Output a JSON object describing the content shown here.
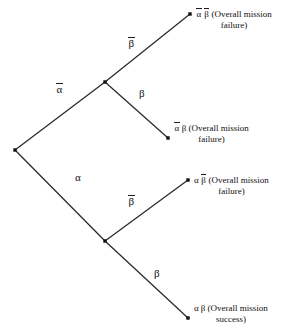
{
  "diagram": {
    "type": "probability-tree",
    "symbols": {
      "alpha": "α",
      "beta": "β",
      "alpha_bar": "α",
      "beta_bar": "β"
    },
    "colors": {
      "background": "#ffffff",
      "line": "#2b2b2b",
      "node": "#111111",
      "text": "#111111"
    },
    "nodes": [
      {
        "id": "root",
        "x": 15,
        "y": 150,
        "kind": "root"
      },
      {
        "id": "n-alpha-bar",
        "x": 105,
        "y": 82,
        "kind": "internal"
      },
      {
        "id": "n-alpha",
        "x": 105,
        "y": 241,
        "kind": "internal"
      },
      {
        "id": "leaf-1",
        "x": 190,
        "y": 14,
        "kind": "leaf"
      },
      {
        "id": "leaf-2",
        "x": 168,
        "y": 138,
        "kind": "leaf"
      },
      {
        "id": "leaf-3",
        "x": 188,
        "y": 180,
        "kind": "leaf"
      },
      {
        "id": "leaf-4",
        "x": 188,
        "y": 318,
        "kind": "leaf"
      }
    ],
    "edges": [
      {
        "id": "edge-root-alpha-bar",
        "from": "root",
        "to": "n-alpha-bar"
      },
      {
        "id": "edge-root-alpha",
        "from": "root",
        "to": "n-alpha"
      },
      {
        "id": "edge-alpha-bar-beta-bar",
        "from": "n-alpha-bar",
        "to": "leaf-1"
      },
      {
        "id": "edge-alpha-bar-beta",
        "from": "n-alpha-bar",
        "to": "leaf-2"
      },
      {
        "id": "edge-alpha-beta-bar",
        "from": "n-alpha",
        "to": "leaf-3"
      },
      {
        "id": "edge-alpha-beta",
        "from": "n-alpha",
        "to": "leaf-4"
      }
    ],
    "branch_labels": [
      {
        "id": "label-alpha-bar",
        "text": "α",
        "overbar": true,
        "x": 56,
        "y": 84
      },
      {
        "id": "label-beta-bar-top",
        "text": "β",
        "overbar": true,
        "x": 128,
        "y": 38
      },
      {
        "id": "label-beta-top",
        "text": "β",
        "overbar": false,
        "x": 139,
        "y": 88
      },
      {
        "id": "label-alpha",
        "text": "α",
        "overbar": false,
        "x": 75,
        "y": 172
      },
      {
        "id": "label-beta-bar-bottom",
        "text": "β",
        "overbar": true,
        "x": 128,
        "y": 196
      },
      {
        "id": "label-beta-bottom",
        "text": "β",
        "overbar": false,
        "x": 154,
        "y": 268
      }
    ],
    "leaf_labels": [
      {
        "id": "leaf-label-1",
        "alpha_bar": true,
        "beta_bar": true,
        "line1": "(Overall mission",
        "line2": "failure)",
        "x": 196,
        "y": 9
      },
      {
        "id": "leaf-label-2",
        "alpha_bar": true,
        "beta_bar": false,
        "line1": "(Overall mission",
        "line2": "failure)",
        "x": 174,
        "y": 123
      },
      {
        "id": "leaf-label-3",
        "alpha_bar": false,
        "beta_bar": true,
        "line1": "(Overall mission",
        "line2": "failure)",
        "x": 194,
        "y": 175
      },
      {
        "id": "leaf-label-4",
        "alpha_bar": false,
        "beta_bar": false,
        "line1": "(Overall mission",
        "line2": "success)",
        "x": 194,
        "y": 303
      }
    ]
  }
}
